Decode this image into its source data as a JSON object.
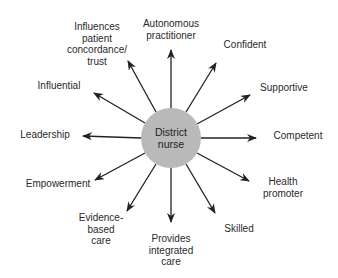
{
  "diagram": {
    "type": "radial-spoke",
    "center": {
      "label": "District\nnurse",
      "fill": "#b9b9b9"
    },
    "arrow_color": "#222222",
    "nodes": [
      {
        "id": "autonomous-practitioner",
        "label": "Autonomous\npractitioner"
      },
      {
        "id": "confident",
        "label": "Confident"
      },
      {
        "id": "supportive",
        "label": "Supportive"
      },
      {
        "id": "competent",
        "label": "Competent"
      },
      {
        "id": "health-promoter",
        "label": "Health\npromoter"
      },
      {
        "id": "skilled",
        "label": "Skilled"
      },
      {
        "id": "provides-integrated-care",
        "label": "Provides\nintegrated\ncare"
      },
      {
        "id": "evidence-based-care",
        "label": "Evidence-\nbased\ncare"
      },
      {
        "id": "empowerment",
        "label": "Empowerment"
      },
      {
        "id": "leadership",
        "label": "Leadership"
      },
      {
        "id": "influential",
        "label": "Influential"
      },
      {
        "id": "influences-patient-concordance-trust",
        "label": "Influences\npatient\nconcordance/\ntrust"
      }
    ]
  }
}
